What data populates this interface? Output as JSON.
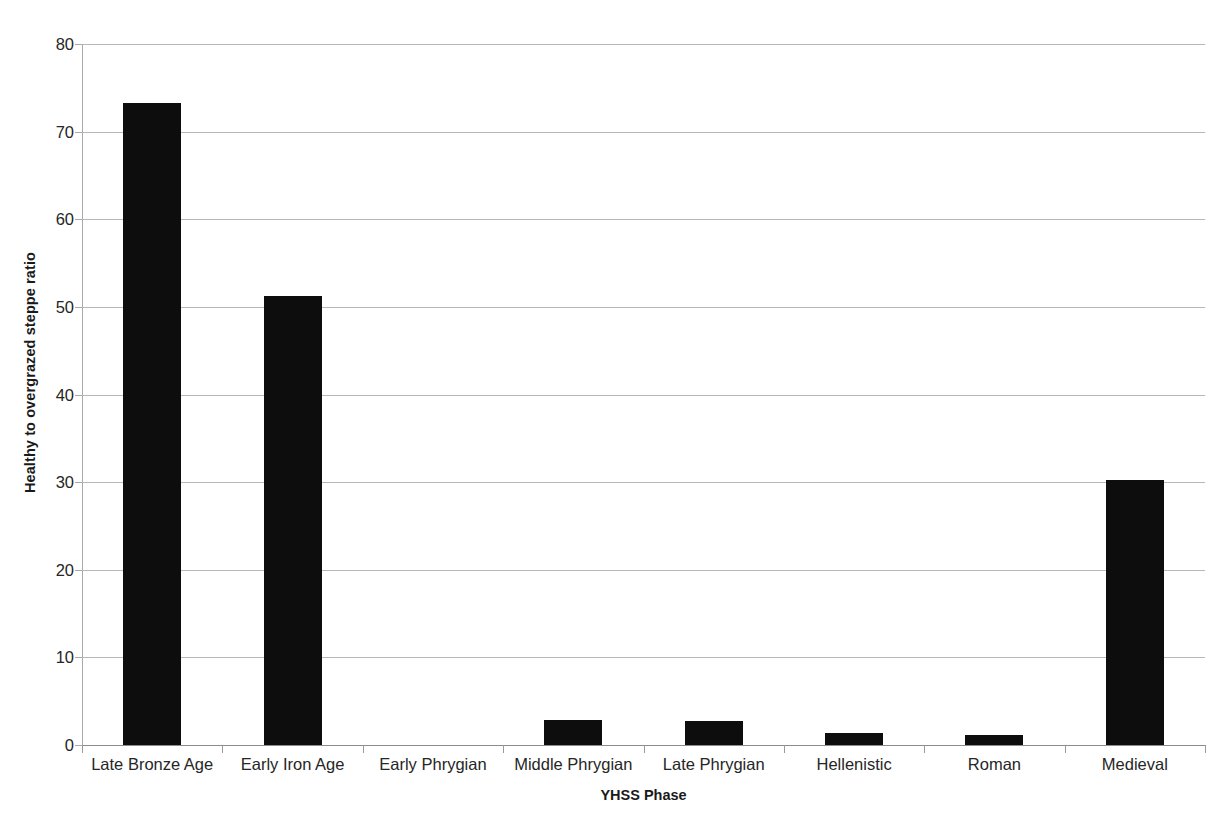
{
  "chart_data": {
    "type": "bar",
    "title": "",
    "subtitle": "",
    "xlabel": "YHSS Phase",
    "ylabel": "Healthy to overgrazed steppe ratio",
    "categories": [
      "Late Bronze Age",
      "Early Iron Age",
      "Early Phrygian",
      "Middle Phrygian",
      "Late Phrygian",
      "Hellenistic",
      "Roman",
      "Medieval"
    ],
    "values": [
      73.3,
      51.2,
      0,
      2.8,
      2.7,
      1.4,
      1.2,
      30.3
    ],
    "ylim": [
      0,
      80
    ],
    "yticks": [
      0,
      10,
      20,
      30,
      40,
      50,
      60,
      70,
      80
    ],
    "ytick_labels": [
      "0",
      "10",
      "20",
      "30",
      "40",
      "50",
      "60",
      "70",
      "80"
    ],
    "grid": true,
    "grid_axis": "y",
    "legend": false,
    "legend_position": "none",
    "bar_color": "#0d0d0d",
    "gridline_color": "#b7b7b7",
    "axis_color": "#8c8c8c",
    "background_color": "#ffffff"
  }
}
